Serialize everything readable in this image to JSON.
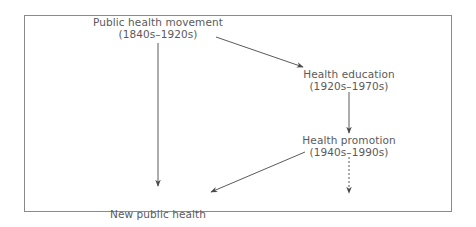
{
  "diagram": {
    "type": "flow",
    "nodes": [
      {
        "id": "public-health-movement",
        "title": "Public health movement",
        "period": "(1840s–1920s)"
      },
      {
        "id": "health-education",
        "title": "Health education",
        "period": "(1920s–1970s)"
      },
      {
        "id": "health-promotion",
        "title": "Health promotion",
        "period": "(1940s–1990s)"
      },
      {
        "id": "new-public-health",
        "title": "New public health",
        "period": "(1980s–        )"
      }
    ],
    "edges": [
      {
        "from": "public-health-movement",
        "to": "health-education",
        "style": "solid"
      },
      {
        "from": "public-health-movement",
        "to": "new-public-health",
        "style": "solid"
      },
      {
        "from": "health-education",
        "to": "health-promotion",
        "style": "solid"
      },
      {
        "from": "health-promotion",
        "to": "new-public-health",
        "style": "solid"
      },
      {
        "from": "health-promotion",
        "to": "continuation",
        "style": "dashed"
      }
    ],
    "colors": {
      "line": "#5a5a5a",
      "text": "#5a5a5a",
      "border": "#8a8a8a"
    }
  }
}
